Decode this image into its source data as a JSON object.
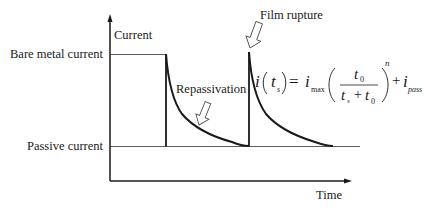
{
  "diagram": {
    "title": "",
    "y_axis_label": "Current",
    "x_axis_label": "Time",
    "levels": {
      "bare_metal": "Bare metal current",
      "passive": "Passive current"
    },
    "annotations": {
      "film_rupture": "Film rupture",
      "repassivation": "Repassivation"
    },
    "formula": {
      "lhs_i": "i",
      "lhs_arg": "t",
      "lhs_arg_sub": "s",
      "equals": "=",
      "imax": "i",
      "imax_sub": "max",
      "num": "t",
      "num_sub": "0",
      "den_a": "t",
      "den_a_sub": "s",
      "plus": "+",
      "den_b": "t",
      "den_b_sub": "0",
      "exponent": "n",
      "plus2": "+",
      "ipass": "i",
      "ipass_sub": "pass"
    },
    "colors": {
      "line": "#1a1a1a",
      "background": "#ffffff"
    }
  }
}
